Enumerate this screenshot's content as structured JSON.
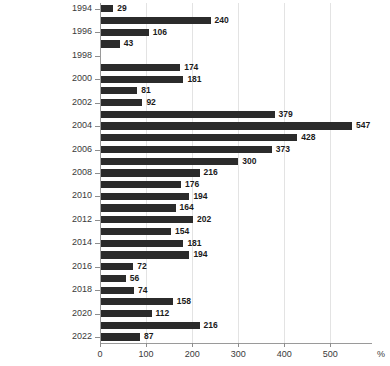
{
  "chart_data": {
    "type": "bar",
    "orientation": "horizontal",
    "title": "",
    "subtitle": "",
    "xlabel": "%",
    "ylabel": "",
    "xlim": [
      0,
      560
    ],
    "ylim": [
      1993.5,
      2022.5
    ],
    "grid": true,
    "grid_axis": "x",
    "legend": null,
    "legend_position": "none",
    "bar_color": "#2b2b2b",
    "gridline_color": "#e3e3e3",
    "axis_color": "#9a9a9a",
    "x_ticks": [
      0,
      100,
      200,
      300,
      400,
      500
    ],
    "x_tick_labels": [
      "0",
      "100",
      "200",
      "300",
      "400",
      "500"
    ],
    "y_ticks": [
      1994,
      1996,
      1998,
      2000,
      2002,
      2004,
      2006,
      2008,
      2010,
      2012,
      2014,
      2016,
      2018,
      2020,
      2022
    ],
    "y_tick_labels": [
      "1994",
      "1996",
      "1998",
      "2000",
      "2002",
      "2004",
      "2006",
      "2008",
      "2010",
      "2012",
      "2014",
      "2016",
      "2018",
      "2020",
      "2022"
    ],
    "categories": [
      1994,
      1995,
      1996,
      1997,
      1998,
      1999,
      2000,
      2001,
      2002,
      2003,
      2004,
      2005,
      2006,
      2007,
      2008,
      2009,
      2010,
      2011,
      2012,
      2013,
      2014,
      2015,
      2016,
      2017,
      2018,
      2019,
      2020,
      2021,
      2022
    ],
    "values": [
      29,
      240,
      106,
      43,
      null,
      174,
      181,
      81,
      92,
      379,
      547,
      428,
      373,
      300,
      216,
      176,
      194,
      164,
      202,
      154,
      181,
      194,
      72,
      56,
      74,
      158,
      112,
      216,
      87
    ],
    "value_labels": [
      "29",
      "240",
      "106",
      "43",
      "",
      "174",
      "181",
      "81",
      "92",
      "379",
      "547",
      "428",
      "373",
      "300",
      "216",
      "176",
      "194",
      "164",
      "202",
      "154",
      "181",
      "194",
      "72",
      "56",
      "74",
      "158",
      "112",
      "216",
      "87"
    ],
    "data_labels_shown": true
  }
}
